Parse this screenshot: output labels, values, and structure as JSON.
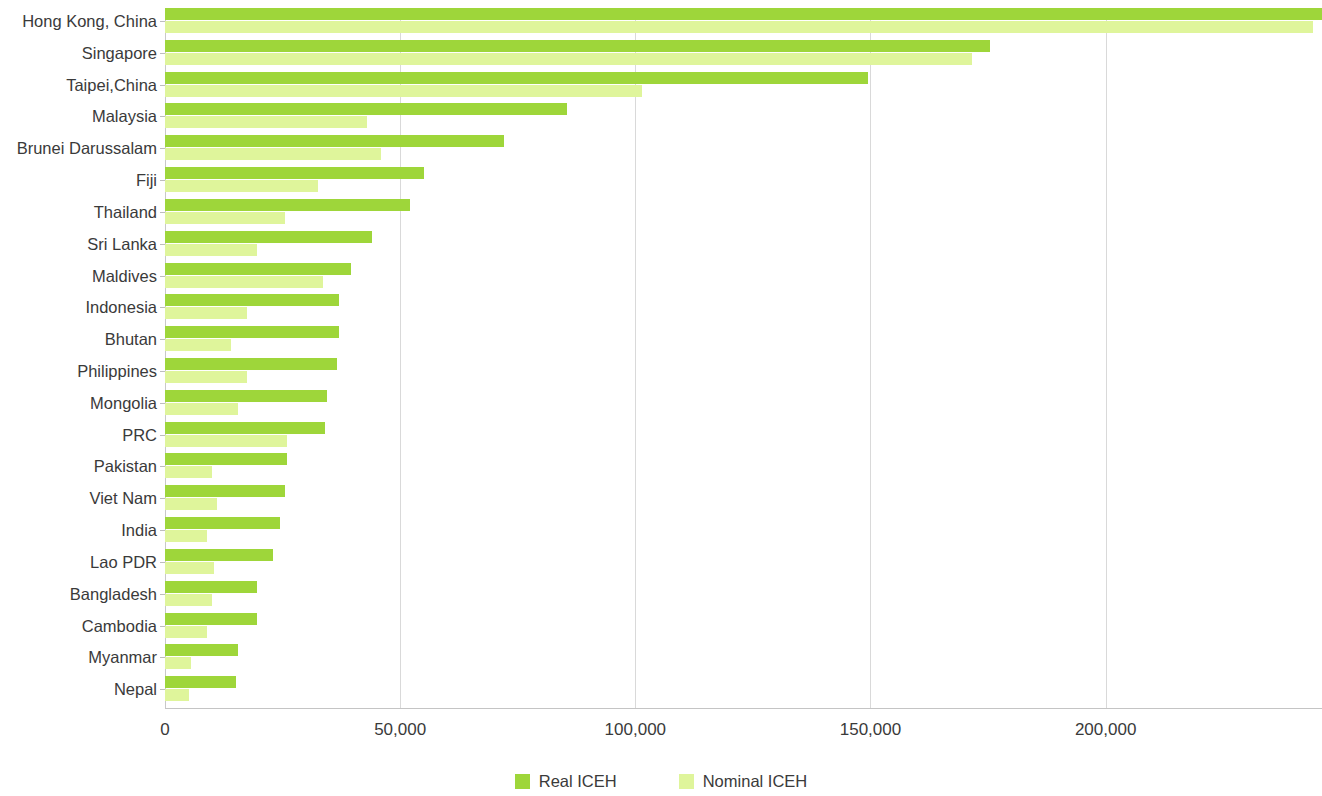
{
  "chart_data": {
    "type": "bar",
    "orientation": "horizontal",
    "title": "",
    "xlabel": "",
    "ylabel": "",
    "xlim": [
      0,
      246000
    ],
    "xticks": [
      0,
      50000,
      100000,
      150000,
      200000
    ],
    "xtick_labels": [
      "0",
      "50,000",
      "100,000",
      "150,000",
      "200,000"
    ],
    "grid": true,
    "grid_axis": "x",
    "legend_position": "bottom-center",
    "categories": [
      "Hong Kong, China",
      "Singapore",
      "Taipei,China",
      "Malaysia",
      "Brunei Darussalam",
      "Fiji",
      "Thailand",
      "Sri Lanka",
      "Maldives",
      "Indonesia",
      "Bhutan",
      "Philippines",
      "Mongolia",
      "PRC",
      "Pakistan",
      "Viet Nam",
      "India",
      "Lao PDR",
      "Bangladesh",
      "Cambodia",
      "Myanmar",
      "Nepal"
    ],
    "series": [
      {
        "name": "Real ICEH",
        "color": "#9ED63A",
        "values": [
          246000,
          175500,
          149500,
          85500,
          72000,
          55000,
          52000,
          44000,
          39500,
          37000,
          37000,
          36500,
          34500,
          34000,
          26000,
          25500,
          24500,
          23000,
          19500,
          19500,
          15500,
          15000
        ]
      },
      {
        "name": "Nominal ICEH",
        "color": "#DFF59B",
        "values": [
          244000,
          171500,
          101500,
          43000,
          46000,
          32500,
          25500,
          19500,
          33500,
          17500,
          14000,
          17500,
          15500,
          26000,
          10000,
          11000,
          9000,
          10500,
          10000,
          9000,
          5500,
          5000
        ]
      }
    ]
  },
  "legend": {
    "items": [
      {
        "label": "Real ICEH",
        "color": "#9ED63A"
      },
      {
        "label": "Nominal ICEH",
        "color": "#DFF59B"
      }
    ]
  },
  "colors": {
    "real": "#9ED63A",
    "nominal": "#DFF59B",
    "gridline": "#d9d9d9",
    "axis": "#c4c4c4",
    "text": "#3a3a3a",
    "background": "#ffffff"
  }
}
